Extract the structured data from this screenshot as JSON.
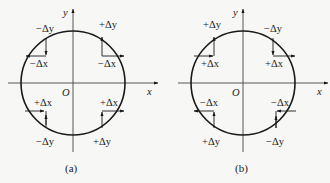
{
  "figure": {
    "diagrams": [
      {
        "id": "a",
        "caption": "(a)",
        "origin_label": "O",
        "x_axis_label": "x",
        "y_axis_label": "y",
        "center": [
          73,
          83
        ],
        "radius": 52,
        "steps": [
          {
            "quadrant": "top-left",
            "dy_label": "−Δy",
            "dx_label": "−Δx"
          },
          {
            "quadrant": "top-right",
            "dy_label": "+Δy",
            "dx_label": "−Δx"
          },
          {
            "quadrant": "bottom-left",
            "dx_label": "+Δx",
            "dy_label": "−Δy"
          },
          {
            "quadrant": "bottom-right",
            "dx_label": "+Δx",
            "dy_label": "+Δy"
          }
        ]
      },
      {
        "id": "b",
        "caption": "(b)",
        "origin_label": "O",
        "x_axis_label": "x",
        "y_axis_label": "y",
        "center": [
          243,
          83
        ],
        "radius": 52,
        "steps": [
          {
            "quadrant": "top-left",
            "dy_label": "+Δy",
            "dx_label": "+Δx"
          },
          {
            "quadrant": "top-right",
            "dy_label": "−Δy",
            "dx_label": "+Δx"
          },
          {
            "quadrant": "bottom-left",
            "dx_label": "−Δx",
            "dy_label": "+Δy"
          },
          {
            "quadrant": "bottom-right",
            "dx_label": "−Δx",
            "dy_label": "−Δy"
          }
        ]
      }
    ],
    "colors": {
      "ink": "#1a1a1a",
      "background": "#f7f7f5"
    }
  }
}
